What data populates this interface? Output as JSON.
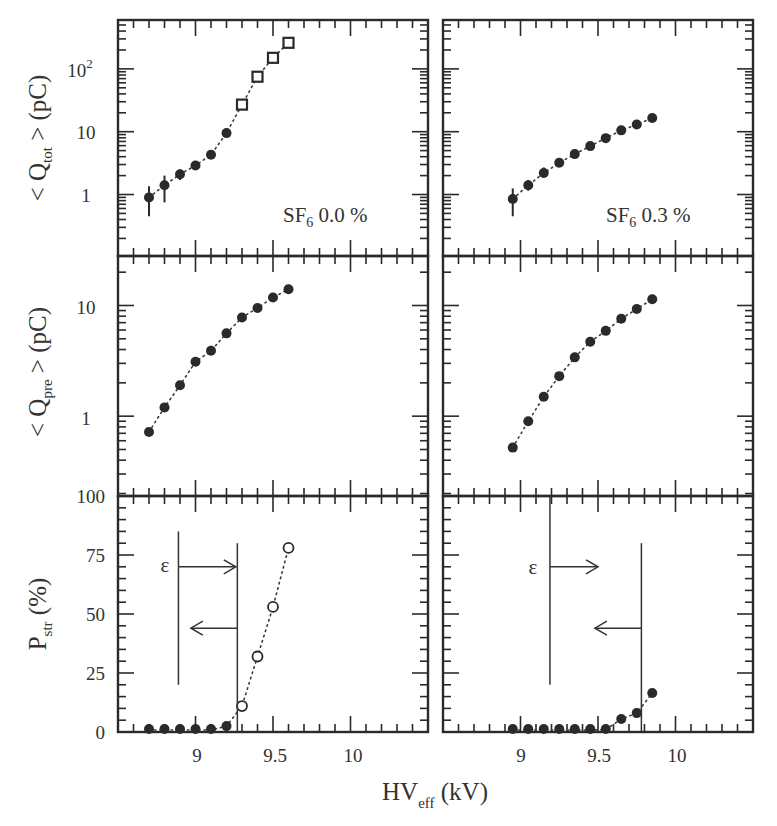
{
  "chart_data": [
    {
      "panel": "top-left",
      "type": "scatter",
      "title": "SF6 0.0 %",
      "annotation": "SF₆ 0.0 %",
      "xlabel": "HV_eff (kV)",
      "ylabel": "< Q_tot > (pC)",
      "yscale": "log",
      "xlim": [
        8.5,
        10.5
      ],
      "ylim": [
        0.105,
        600
      ],
      "ytick_labels": [
        "1",
        "10",
        "10²"
      ],
      "series": [
        {
          "name": "avalanche (filled circles)",
          "marker": "filled-circle",
          "x": [
            8.7,
            8.8,
            8.9,
            9.0,
            9.1,
            9.2
          ],
          "y": [
            0.9,
            1.4,
            2.1,
            2.9,
            4.3,
            9.5
          ],
          "yerr_low": [
            0.45,
            0.75,
            1.7,
            2.6,
            4.0,
            9.0
          ],
          "yerr_high": [
            1.35,
            2.0,
            2.5,
            3.2,
            4.6,
            10.0
          ]
        },
        {
          "name": "streamer (open squares)",
          "marker": "open-square",
          "x": [
            9.3,
            9.4,
            9.5,
            9.6
          ],
          "y": [
            27,
            75,
            150,
            260
          ]
        }
      ],
      "fit_line": "dotted"
    },
    {
      "panel": "top-right",
      "type": "scatter",
      "title": "SF6 0.3 %",
      "annotation": "SF₆ 0.3 %",
      "yscale": "log",
      "xlim": [
        8.5,
        10.5
      ],
      "ylim": [
        0.105,
        600
      ],
      "series": [
        {
          "name": "avalanche (filled circles)",
          "marker": "filled-circle",
          "x": [
            8.95,
            9.05,
            9.15,
            9.25,
            9.35,
            9.45,
            9.55,
            9.65,
            9.75,
            9.85
          ],
          "y": [
            0.85,
            1.4,
            2.2,
            3.2,
            4.4,
            5.9,
            7.9,
            10.5,
            13.0,
            16.5
          ],
          "yerr_low": [
            0.45,
            1.15,
            1.85,
            3.0,
            4.2,
            5.7,
            7.7,
            10.3,
            12.8,
            16.2
          ],
          "yerr_high": [
            1.25,
            1.7,
            2.7,
            3.4,
            4.6,
            6.1,
            8.1,
            10.7,
            13.2,
            16.8
          ]
        }
      ],
      "fit_line": "dotted"
    },
    {
      "panel": "middle-left",
      "type": "scatter",
      "ylabel": "< Q_pre > (pC)",
      "yscale": "log",
      "xlim": [
        8.5,
        10.5
      ],
      "ylim": [
        0.19,
        28
      ],
      "ytick_labels": [
        "1",
        "10"
      ],
      "series": [
        {
          "name": "precursor charge",
          "marker": "filled-circle",
          "x": [
            8.7,
            8.8,
            8.9,
            9.0,
            9.1,
            9.2,
            9.3,
            9.4,
            9.5,
            9.6
          ],
          "y": [
            0.72,
            1.2,
            1.9,
            3.1,
            3.9,
            5.6,
            7.8,
            9.5,
            11.8,
            14.0
          ]
        }
      ],
      "fit_line": "dotted"
    },
    {
      "panel": "middle-right",
      "type": "scatter",
      "yscale": "log",
      "xlim": [
        8.5,
        10.5
      ],
      "ylim": [
        0.19,
        28
      ],
      "series": [
        {
          "name": "precursor charge",
          "marker": "filled-circle",
          "x": [
            8.95,
            9.05,
            9.15,
            9.25,
            9.35,
            9.45,
            9.55,
            9.65,
            9.75,
            9.85
          ],
          "y": [
            0.52,
            0.9,
            1.5,
            2.3,
            3.4,
            4.7,
            5.9,
            7.6,
            9.3,
            11.4
          ]
        }
      ],
      "fit_line": "dotted"
    },
    {
      "panel": "bottom-left",
      "type": "scatter",
      "xlabel": "HV_eff (kV)",
      "ylabel": "P_str (%)",
      "yscale": "linear",
      "xlim": [
        8.5,
        10.5
      ],
      "ylim": [
        0,
        100
      ],
      "ytick_labels": [
        "0",
        "25",
        "50",
        "75",
        "100"
      ],
      "xtick_labels": [
        "9",
        "9.5",
        "10"
      ],
      "series": [
        {
          "name": "below threshold (filled)",
          "marker": "filled-circle",
          "x": [
            8.7,
            8.8,
            8.9,
            9.0,
            9.1,
            9.2
          ],
          "y": [
            0.3,
            0.3,
            0.3,
            0.3,
            0.6,
            2.5
          ]
        },
        {
          "name": "streamer probability (open)",
          "marker": "open-circle",
          "x": [
            9.3,
            9.4,
            9.5,
            9.6
          ],
          "y": [
            11,
            32,
            53,
            78
          ]
        }
      ],
      "fit_line": "dotted",
      "annotations": {
        "epsilon_label": "ε",
        "efficiency_line_x": 8.89,
        "efficiency_line_y": [
          20,
          85
        ],
        "efficiency_arrow": {
          "direction": "right",
          "y": 70,
          "x_from": 8.89,
          "x_to": 9.26
        },
        "streamer_line_x": 9.27,
        "streamer_line_y": [
          0,
          80
        ],
        "streamer_arrow": {
          "direction": "left",
          "y": 44,
          "x_from": 9.27,
          "x_to": 8.97
        }
      }
    },
    {
      "panel": "bottom-right",
      "type": "scatter",
      "yscale": "linear",
      "xlim": [
        8.5,
        10.5
      ],
      "ylim": [
        0,
        100
      ],
      "xtick_labels": [
        "9",
        "9.5",
        "10"
      ],
      "series": [
        {
          "name": "streamer probability",
          "marker": "filled-circle",
          "x": [
            8.95,
            9.05,
            9.15,
            9.25,
            9.35,
            9.45,
            9.55,
            9.65,
            9.75,
            9.85
          ],
          "y": [
            0.2,
            0.2,
            0.2,
            0.3,
            0.3,
            0.4,
            1.0,
            5.5,
            8.0,
            16.5
          ]
        }
      ],
      "fit_line": "dotted",
      "annotations": {
        "epsilon_label": "ε",
        "efficiency_line_x": 9.19,
        "efficiency_line_y": [
          20,
          100
        ],
        "efficiency_arrow": {
          "direction": "right",
          "y": 70,
          "x_from": 9.19,
          "x_to": 9.5
        },
        "streamer_line_x": 9.78,
        "streamer_line_y": [
          0,
          80
        ],
        "streamer_arrow": {
          "direction": "left",
          "y": 44,
          "x_from": 9.78,
          "x_to": 9.48
        }
      }
    }
  ],
  "labels": {
    "ylabel_top_main": "< Q",
    "ylabel_top_sub": "tot",
    "ylabel_top_tail": " > (pC)",
    "ylabel_mid_main": "< Q",
    "ylabel_mid_sub": "pre",
    "ylabel_mid_tail": " > (pC)",
    "ylabel_bot_main": "P",
    "ylabel_bot_sub": "str",
    "ylabel_bot_tail": " (%)",
    "xlabel_main": "HV",
    "xlabel_sub": "eff",
    "xlabel_tail": " (kV)",
    "sf6_left_main": "SF",
    "sf6_left_sub": "6",
    "sf6_left_tail": " 0.0 %",
    "sf6_right_main": "SF",
    "sf6_right_sub": "6",
    "sf6_right_tail": " 0.3 %",
    "epsilon": "ε",
    "ytick_top": [
      "1",
      "10",
      "10",
      "2"
    ],
    "ytick_mid": [
      "1",
      "10"
    ],
    "ytick_bot": [
      "0",
      "25",
      "50",
      "75",
      "100"
    ],
    "xtick": [
      "9",
      "9.5",
      "10"
    ]
  }
}
